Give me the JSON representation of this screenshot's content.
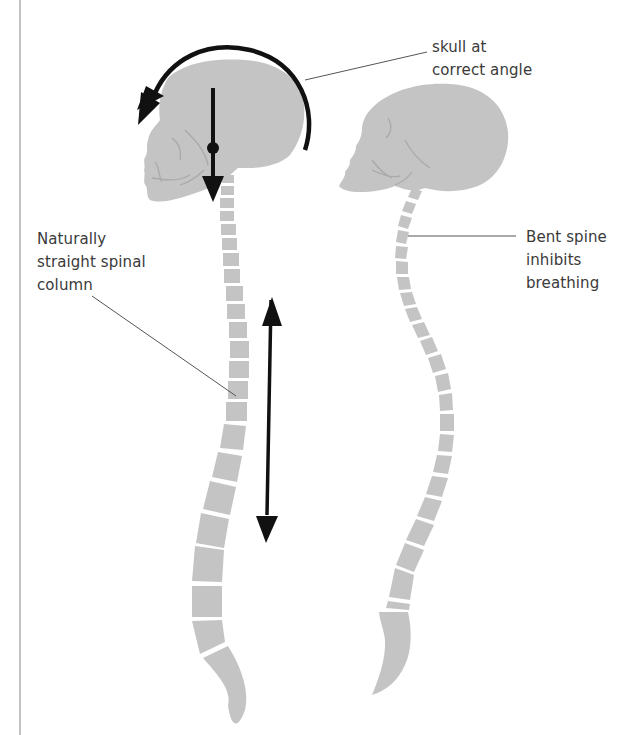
{
  "diagram": {
    "type": "posture comparison illustration",
    "colors": {
      "bone_fill": "#c4c4c4",
      "bone_detail": "#a9a9a9",
      "arrow": "#111111",
      "leader_line": "#555555",
      "text": "#3a3a3a",
      "border_line": "#9a9a9a"
    },
    "figures": [
      {
        "id": "correct",
        "description": "Upright skull with naturally straight spinal column",
        "annotations": [
          "curved rotation arrow around skull",
          "vertical downward arrow through skull with pivot dot",
          "double-headed vertical arrow alongside spine"
        ]
      },
      {
        "id": "incorrect",
        "description": "Forward-tilted skull with bent spinal column"
      }
    ],
    "labels": {
      "skull_angle": [
        "skull at",
        "correct angle"
      ],
      "straight_spine": [
        "Naturally",
        "straight spinal",
        "column"
      ],
      "bent_spine": [
        "Bent spine",
        "inhibits",
        "breathing"
      ]
    }
  }
}
